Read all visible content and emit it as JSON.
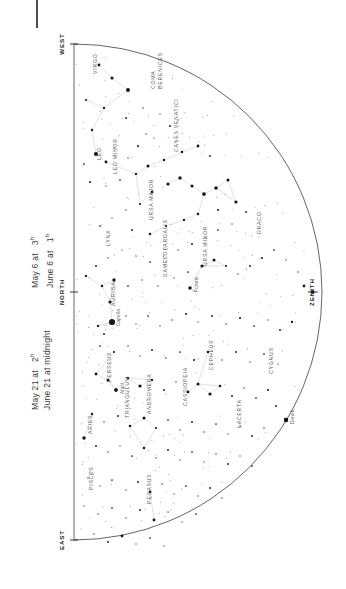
{
  "document": {
    "type": "star-chart",
    "hemisphere_view": "northern sky, looking north",
    "orientation_note": "chart drawn rotated 90 degrees on the page"
  },
  "captions": [
    {
      "lines": [
        "May 6 at",
        "June 6 at"
      ],
      "times": [
        "3",
        "1"
      ],
      "suffix": "h"
    },
    {
      "lines": [
        "May 21 at",
        "June 21 at midnight"
      ],
      "times": [
        "2",
        ""
      ],
      "suffix": "h"
    }
  ],
  "caption_text": {
    "left_block": [
      {
        "date": "May 6 at",
        "time": "3",
        "unit": "h"
      },
      {
        "date": "June 6 at",
        "time": "1",
        "unit": "h"
      }
    ],
    "right_block": [
      {
        "date": "May 21 at",
        "time": "2",
        "unit": "h"
      },
      {
        "date": "June 21 at midnight",
        "time": "",
        "unit": ""
      }
    ]
  },
  "cardinals": [
    {
      "name": "WEST",
      "x": 18,
      "y": 10
    },
    {
      "name": "NORTH",
      "x": 18,
      "y": 258
    },
    {
      "name": "EAST",
      "x": 18,
      "y": 506
    },
    {
      "name": "ZENITH",
      "x": 268,
      "y": 258
    }
  ],
  "chart_data": {
    "type": "scatter",
    "xlabel": "",
    "ylabel": "",
    "xlim": [
      0,
      296
    ],
    "ylim": [
      0,
      520
    ],
    "grid": false,
    "legend": "none",
    "horizon": {
      "shape": "semicircle",
      "baseline_x": 34,
      "center_y": 258,
      "radius": 248
    },
    "constellations": [
      {
        "name": "VIRGO",
        "x": 52,
        "y": 40,
        "rot": -90
      },
      {
        "name": "COMA",
        "x": 110,
        "y": 55,
        "rot": -90
      },
      {
        "name": "BERENICES",
        "x": 117,
        "y": 55,
        "rot": -90
      },
      {
        "name": "LEO",
        "x": 56,
        "y": 126,
        "rot": -90
      },
      {
        "name": "LEO MINOR",
        "x": 72,
        "y": 140,
        "rot": -90
      },
      {
        "name": "CANES VENATICI",
        "x": 133,
        "y": 118,
        "rot": -90
      },
      {
        "name": "URSA MAJOR",
        "x": 108,
        "y": 186,
        "rot": -90
      },
      {
        "name": "LYNX",
        "x": 65,
        "y": 212,
        "rot": -90
      },
      {
        "name": "URSA MINOR",
        "x": 162,
        "y": 232,
        "rot": -90
      },
      {
        "name": "CAMELOPARDALIS",
        "x": 122,
        "y": 243,
        "rot": -90
      },
      {
        "name": "DRACO",
        "x": 216,
        "y": 200,
        "rot": -90
      },
      {
        "name": "AURIGA",
        "x": 70,
        "y": 272,
        "rot": -90
      },
      {
        "name": "PERSEUS",
        "x": 66,
        "y": 348,
        "rot": -90
      },
      {
        "name": "CEPHEUS",
        "x": 168,
        "y": 336,
        "rot": -90
      },
      {
        "name": "CASSIOPEIA",
        "x": 142,
        "y": 372,
        "rot": -90
      },
      {
        "name": "CYGNUS",
        "x": 228,
        "y": 340,
        "rot": -90
      },
      {
        "name": "LACERTA",
        "x": 196,
        "y": 394,
        "rot": -90
      },
      {
        "name": "ANDROMEDA",
        "x": 106,
        "y": 380,
        "rot": -90
      },
      {
        "name": "TRIANGULUM",
        "x": 84,
        "y": 384,
        "rot": -90
      },
      {
        "name": "ARIES",
        "x": 47,
        "y": 400,
        "rot": -90
      },
      {
        "name": "PISCES",
        "x": 48,
        "y": 456,
        "rot": -90
      },
      {
        "name": "PEGASUS",
        "x": 106,
        "y": 470,
        "rot": -90
      }
    ],
    "named_stars": [
      {
        "name": "Capella",
        "x": 72,
        "y": 288,
        "mag": 0.1
      },
      {
        "name": "Polaris",
        "x": 150,
        "y": 254,
        "mag": 2.0
      },
      {
        "name": "Algol",
        "x": 76,
        "y": 356,
        "mag": 2.1
      },
      {
        "name": "Deneb",
        "x": 246,
        "y": 386,
        "mag": 1.3
      }
    ],
    "stars": [
      [
        59,
        31,
        2.6
      ],
      [
        72,
        44,
        2.3
      ],
      [
        88,
        56,
        1.6
      ],
      [
        46,
        66,
        3.2
      ],
      [
        64,
        74,
        3.0
      ],
      [
        52,
        96,
        2.9
      ],
      [
        86,
        84,
        3.4
      ],
      [
        103,
        74,
        3.6
      ],
      [
        120,
        80,
        3.8
      ],
      [
        130,
        92,
        3.4
      ],
      [
        138,
        86,
        3.9
      ],
      [
        106,
        100,
        3.6
      ],
      [
        114,
        104,
        3.9
      ],
      [
        98,
        112,
        3.3
      ],
      [
        56,
        120,
        1.4
      ],
      [
        66,
        128,
        2.6
      ],
      [
        44,
        130,
        3.5
      ],
      [
        74,
        114,
        3.6
      ],
      [
        88,
        124,
        3.7
      ],
      [
        50,
        148,
        3.3
      ],
      [
        66,
        152,
        3.8
      ],
      [
        80,
        146,
        3.5
      ],
      [
        96,
        140,
        3.0
      ],
      [
        108,
        132,
        2.4
      ],
      [
        124,
        126,
        2.9
      ],
      [
        142,
        118,
        2.8
      ],
      [
        158,
        112,
        2.6
      ],
      [
        170,
        122,
        3.4
      ],
      [
        112,
        158,
        2.4
      ],
      [
        128,
        150,
        2.2
      ],
      [
        140,
        144,
        2.1
      ],
      [
        152,
        152,
        2.3
      ],
      [
        164,
        160,
        1.8
      ],
      [
        176,
        154,
        2.0
      ],
      [
        188,
        146,
        2.4
      ],
      [
        100,
        170,
        3.2
      ],
      [
        86,
        176,
        3.6
      ],
      [
        72,
        184,
        3.8
      ],
      [
        60,
        192,
        3.5
      ],
      [
        92,
        196,
        3.4
      ],
      [
        110,
        200,
        2.9
      ],
      [
        126,
        192,
        3.1
      ],
      [
        144,
        186,
        3.0
      ],
      [
        158,
        180,
        2.8
      ],
      [
        178,
        176,
        3.3
      ],
      [
        196,
        168,
        2.2
      ],
      [
        206,
        178,
        3.4
      ],
      [
        192,
        190,
        3.6
      ],
      [
        178,
        196,
        3.5
      ],
      [
        166,
        204,
        3.7
      ],
      [
        152,
        210,
        3.4
      ],
      [
        138,
        216,
        3.6
      ],
      [
        124,
        222,
        3.8
      ],
      [
        110,
        228,
        3.5
      ],
      [
        96,
        222,
        3.7
      ],
      [
        82,
        216,
        3.9
      ],
      [
        68,
        224,
        3.6
      ],
      [
        56,
        232,
        3.4
      ],
      [
        46,
        242,
        3.0
      ],
      [
        62,
        252,
        2.9
      ],
      [
        74,
        246,
        2.1
      ],
      [
        88,
        252,
        3.5
      ],
      [
        102,
        246,
        3.7
      ],
      [
        118,
        252,
        3.6
      ],
      [
        134,
        244,
        3.8
      ],
      [
        148,
        238,
        3.5
      ],
      [
        162,
        232,
        2.2
      ],
      [
        174,
        226,
        2.4
      ],
      [
        186,
        232,
        3.2
      ],
      [
        198,
        240,
        3.6
      ],
      [
        210,
        232,
        3.4
      ],
      [
        222,
        224,
        3.1
      ],
      [
        234,
        216,
        3.5
      ],
      [
        246,
        226,
        3.8
      ],
      [
        258,
        238,
        3.6
      ],
      [
        264,
        252,
        2.6
      ],
      [
        70,
        268,
        2.2
      ],
      [
        72,
        288,
        0.1
      ],
      [
        58,
        292,
        3.0
      ],
      [
        64,
        300,
        3.4
      ],
      [
        86,
        282,
        3.6
      ],
      [
        96,
        290,
        3.8
      ],
      [
        108,
        282,
        3.5
      ],
      [
        120,
        292,
        3.7
      ],
      [
        132,
        286,
        3.6
      ],
      [
        146,
        280,
        3.3
      ],
      [
        158,
        288,
        3.8
      ],
      [
        172,
        282,
        3.4
      ],
      [
        186,
        290,
        3.6
      ],
      [
        200,
        284,
        3.2
      ],
      [
        214,
        292,
        3.5
      ],
      [
        228,
        286,
        3.7
      ],
      [
        240,
        296,
        3.4
      ],
      [
        252,
        288,
        3.0
      ],
      [
        60,
        312,
        3.5
      ],
      [
        74,
        318,
        3.2
      ],
      [
        88,
        312,
        3.6
      ],
      [
        100,
        322,
        3.8
      ],
      [
        112,
        316,
        3.4
      ],
      [
        126,
        324,
        3.6
      ],
      [
        140,
        318,
        3.5
      ],
      [
        154,
        326,
        3.3
      ],
      [
        168,
        318,
        2.8
      ],
      [
        182,
        326,
        3.6
      ],
      [
        196,
        318,
        3.4
      ],
      [
        210,
        328,
        3.7
      ],
      [
        224,
        320,
        3.5
      ],
      [
        238,
        330,
        3.8
      ],
      [
        56,
        340,
        2.6
      ],
      [
        68,
        346,
        2.4
      ],
      [
        76,
        356,
        2.1
      ],
      [
        88,
        344,
        2.9
      ],
      [
        100,
        352,
        2.2
      ],
      [
        112,
        346,
        3.0
      ],
      [
        124,
        356,
        3.4
      ],
      [
        136,
        348,
        3.6
      ],
      [
        148,
        358,
        2.6
      ],
      [
        158,
        350,
        2.4
      ],
      [
        170,
        360,
        2.2
      ],
      [
        180,
        352,
        2.7
      ],
      [
        192,
        362,
        3.4
      ],
      [
        204,
        354,
        3.6
      ],
      [
        216,
        364,
        3.5
      ],
      [
        228,
        356,
        3.2
      ],
      [
        246,
        386,
        1.3
      ],
      [
        236,
        372,
        3.4
      ],
      [
        52,
        380,
        2.9
      ],
      [
        64,
        388,
        3.6
      ],
      [
        78,
        382,
        3.4
      ],
      [
        90,
        392,
        2.8
      ],
      [
        104,
        384,
        2.4
      ],
      [
        116,
        394,
        3.2
      ],
      [
        128,
        386,
        3.5
      ],
      [
        140,
        396,
        3.7
      ],
      [
        152,
        388,
        3.4
      ],
      [
        164,
        398,
        3.6
      ],
      [
        176,
        390,
        3.5
      ],
      [
        188,
        400,
        3.8
      ],
      [
        200,
        392,
        3.6
      ],
      [
        212,
        402,
        3.4
      ],
      [
        224,
        394,
        3.7
      ],
      [
        44,
        404,
        2.0
      ],
      [
        56,
        412,
        3.4
      ],
      [
        68,
        418,
        3.6
      ],
      [
        80,
        412,
        3.8
      ],
      [
        92,
        422,
        3.5
      ],
      [
        104,
        414,
        2.8
      ],
      [
        116,
        424,
        3.6
      ],
      [
        128,
        416,
        3.4
      ],
      [
        140,
        426,
        3.7
      ],
      [
        152,
        418,
        3.5
      ],
      [
        164,
        428,
        3.8
      ],
      [
        176,
        420,
        3.6
      ],
      [
        188,
        430,
        3.4
      ],
      [
        200,
        422,
        3.7
      ],
      [
        212,
        432,
        3.5
      ],
      [
        48,
        444,
        3.6
      ],
      [
        60,
        452,
        3.8
      ],
      [
        72,
        446,
        3.5
      ],
      [
        86,
        456,
        3.7
      ],
      [
        98,
        448,
        3.4
      ],
      [
        110,
        458,
        2.5
      ],
      [
        122,
        450,
        3.6
      ],
      [
        134,
        460,
        3.8
      ],
      [
        146,
        452,
        3.5
      ],
      [
        158,
        462,
        3.7
      ],
      [
        170,
        454,
        3.4
      ],
      [
        182,
        464,
        3.6
      ],
      [
        44,
        472,
        3.8
      ],
      [
        58,
        480,
        3.6
      ],
      [
        72,
        474,
        3.5
      ],
      [
        86,
        484,
        3.7
      ],
      [
        100,
        476,
        3.4
      ],
      [
        114,
        486,
        2.5
      ],
      [
        128,
        478,
        3.6
      ],
      [
        142,
        488,
        3.8
      ],
      [
        156,
        480,
        3.5
      ],
      [
        54,
        500,
        3.6
      ],
      [
        68,
        508,
        3.4
      ],
      [
        82,
        502,
        2.6
      ],
      [
        96,
        510,
        3.7
      ],
      [
        110,
        504,
        3.5
      ],
      [
        124,
        512,
        3.8
      ]
    ]
  }
}
